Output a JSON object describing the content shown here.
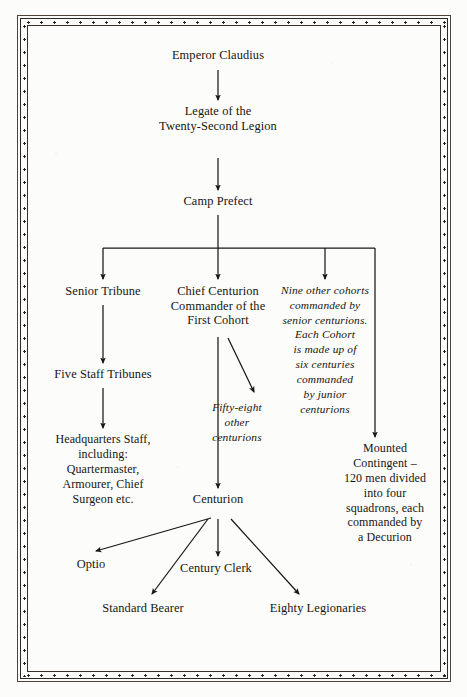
{
  "page": {
    "background_color": "#fcfcfb",
    "ink_color": "#17140f",
    "border_style": "double-rule-with-rivets"
  },
  "nodes": {
    "emperor": {
      "label": "Emperor Claudius",
      "x": 218,
      "y": 57,
      "style": "roman"
    },
    "legate": {
      "label": "Legate of the\nTwenty-Second Legion",
      "x": 218,
      "y": 113,
      "style": "roman"
    },
    "camp_prefect": {
      "label": "Camp Prefect",
      "x": 218,
      "y": 202,
      "style": "roman"
    },
    "senior_tribune": {
      "label": "Senior Tribune",
      "x": 103,
      "y": 291,
      "style": "roman"
    },
    "chief_centurion": {
      "label": "Chief Centurion\nCommander of the\nFirst Cohort",
      "x": 218,
      "y": 291,
      "style": "roman"
    },
    "nine_cohorts": {
      "label": "Nine other cohorts\ncommanded by\nsenior centurions.\nEach Cohort\nis made up of\nsix centuries\ncommanded\nby junior\ncenturions",
      "x": 325,
      "y": 290,
      "style": "italic"
    },
    "five_staff": {
      "label": "Five Staff Tribunes",
      "x": 103,
      "y": 375,
      "style": "roman"
    },
    "fifty_eight": {
      "label": "Fifty-eight\nother\ncenturions",
      "x": 237,
      "y": 409,
      "style": "italic"
    },
    "headquarters": {
      "label": "Headquarters Staff,\nincluding:\nQuartermaster,\nArmourer, Chief\nSurgeon etc.",
      "x": 103,
      "y": 440,
      "style": "small"
    },
    "mounted": {
      "label": "Mounted\nContingent –\n120 men divided\ninto four\nsquadrons, each\ncommanded by\na Decurion",
      "x": 385,
      "y": 449,
      "style": "small"
    },
    "centurion": {
      "label": "Centurion",
      "x": 218,
      "y": 499,
      "style": "roman"
    },
    "optio": {
      "label": "Optio",
      "x": 91,
      "y": 564,
      "style": "roman"
    },
    "century_clerk": {
      "label": "Century Clerk",
      "x": 216,
      "y": 568,
      "style": "roman"
    },
    "standard_bearer": {
      "label": "Standard Bearer",
      "x": 143,
      "y": 608,
      "style": "roman"
    },
    "eighty_legionaries": {
      "label": "Eighty Legionaries",
      "x": 318,
      "y": 608,
      "style": "roman"
    }
  },
  "edges": [
    {
      "name": "emperor-to-legate",
      "from": "emperor",
      "to": "legate",
      "kind": "vertical-arrow"
    },
    {
      "name": "legate-to-camp-prefect",
      "from": "legate",
      "to": "camp_prefect",
      "kind": "vertical-arrow"
    },
    {
      "name": "camp-prefect-to-branch-bar",
      "from": "camp_prefect",
      "to": "distribution-bar",
      "kind": "vertical-line"
    },
    {
      "name": "branch-to-senior-tribune",
      "from": "distribution-bar",
      "to": "senior_tribune",
      "kind": "elbow-arrow"
    },
    {
      "name": "branch-to-chief-centurion",
      "from": "distribution-bar",
      "to": "chief_centurion",
      "kind": "vertical-arrow"
    },
    {
      "name": "branch-to-nine-cohorts",
      "from": "distribution-bar",
      "to": "nine_cohorts",
      "kind": "elbow-arrow"
    },
    {
      "name": "branch-to-mounted-contingent",
      "from": "distribution-bar",
      "to": "mounted",
      "kind": "elbow-arrow"
    },
    {
      "name": "senior-tribune-to-five-staff",
      "from": "senior_tribune",
      "to": "five_staff",
      "kind": "vertical-arrow"
    },
    {
      "name": "five-staff-to-headquarters",
      "from": "five_staff",
      "to": "headquarters",
      "kind": "vertical-arrow"
    },
    {
      "name": "chief-centurion-to-centurion",
      "from": "chief_centurion",
      "to": "centurion",
      "kind": "vertical-arrow"
    },
    {
      "name": "chief-centurion-to-fifty-eight",
      "from": "chief_centurion",
      "to": "fifty_eight",
      "kind": "diagonal-arrow"
    },
    {
      "name": "centurion-to-optio",
      "from": "centurion",
      "to": "optio",
      "kind": "diagonal-arrow"
    },
    {
      "name": "centurion-to-standard-bearer",
      "from": "centurion",
      "to": "standard_bearer",
      "kind": "diagonal-arrow"
    },
    {
      "name": "centurion-to-century-clerk",
      "from": "centurion",
      "to": "century_clerk",
      "kind": "vertical-arrow"
    },
    {
      "name": "centurion-to-eighty-legionaries",
      "from": "centurion",
      "to": "eighty_legionaries",
      "kind": "diagonal-arrow"
    }
  ]
}
